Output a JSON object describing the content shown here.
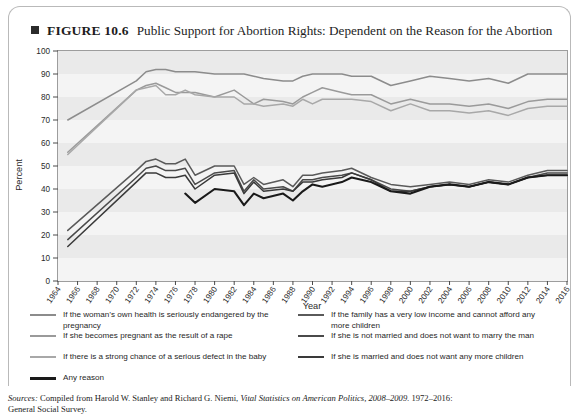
{
  "figure": {
    "marker": "■",
    "number": "FIGURE 10.6",
    "title": "Public Support for Abortion Rights: Dependent on the Reason for the Abortion"
  },
  "source": {
    "prefix": "Sources:",
    "line1_plain_a": " Compiled from Harold W. Stanley and Richard G. Niemi, ",
    "line1_italic": "Vital Statistics on American Politics, 2008–2009.",
    "line1_plain_b": " 1972–2016:",
    "line2": "General Social Survey."
  },
  "legend": {
    "items": [
      {
        "label": "If the woman’s own health is seriously endangered by the pregnancy",
        "color": "#8c8c8c",
        "name": "legend-item-health"
      },
      {
        "label": "If she becomes pregnant as the result of a rape",
        "color": "#9a9a9a",
        "name": "legend-item-rape"
      },
      {
        "label": "If there is a strong chance of a serious defect in the baby",
        "color": "#a8a8a8",
        "name": "legend-item-defect"
      },
      {
        "label": "Any reason",
        "color": "#1a1a1a",
        "name": "legend-item-any-reason"
      },
      {
        "label": "If the family has a very low income and cannot afford any more children",
        "color": "#5a5a5a",
        "name": "legend-item-low-income"
      },
      {
        "label": "If she is not married and does not want to marry the man",
        "color": "#4a4a4a",
        "name": "legend-item-not-married"
      },
      {
        "label": "If she is married and does not want any more children",
        "color": "#3a3a3a",
        "name": "legend-item-married-no-more"
      }
    ]
  },
  "chart_data": {
    "type": "line",
    "title": "Public Support for Abortion Rights: Dependent on the Reason for the Abortion",
    "xlabel": "Year",
    "ylabel": "Percent",
    "ylim": [
      0,
      100
    ],
    "ytick_step": 10,
    "yticks": [
      0,
      10,
      20,
      30,
      40,
      50,
      60,
      70,
      80,
      90,
      100
    ],
    "xlim": [
      1964,
      2016
    ],
    "xticks": [
      1964,
      1966,
      1968,
      1970,
      1972,
      1974,
      1976,
      1978,
      1980,
      1982,
      1984,
      1986,
      1988,
      1990,
      1992,
      1994,
      1996,
      1998,
      2000,
      2002,
      2004,
      2006,
      2008,
      2010,
      2012,
      2014,
      2016
    ],
    "grid": "horizontal-bands",
    "legend_position": "below",
    "series": [
      {
        "name": "If the woman’s own health is seriously endangered by the pregnancy",
        "color": "#8c8c8c",
        "x": [
          1965,
          1972,
          1973,
          1974,
          1975,
          1976,
          1977,
          1978,
          1980,
          1982,
          1983,
          1984,
          1985,
          1987,
          1988,
          1989,
          1990,
          1991,
          1993,
          1994,
          1996,
          1998,
          2000,
          2002,
          2004,
          2006,
          2008,
          2010,
          2012,
          2014,
          2016
        ],
        "values": [
          70,
          87,
          91,
          92,
          92,
          91,
          91,
          91,
          90,
          90,
          90,
          89,
          88,
          87,
          87,
          89,
          90,
          90,
          90,
          89,
          89,
          85,
          87,
          89,
          88,
          87,
          88,
          86,
          90,
          90,
          90
        ]
      },
      {
        "name": "If she becomes pregnant as the result of a rape",
        "color": "#9a9a9a",
        "x": [
          1965,
          1972,
          1973,
          1974,
          1975,
          1976,
          1977,
          1978,
          1980,
          1982,
          1983,
          1984,
          1985,
          1987,
          1988,
          1989,
          1990,
          1991,
          1993,
          1994,
          1996,
          1998,
          2000,
          2002,
          2004,
          2006,
          2008,
          2010,
          2012,
          2014,
          2016
        ],
        "values": [
          56,
          83,
          85,
          86,
          84,
          82,
          82,
          82,
          80,
          83,
          80,
          77,
          79,
          78,
          77,
          80,
          82,
          84,
          82,
          81,
          81,
          77,
          79,
          77,
          77,
          76,
          77,
          75,
          78,
          79,
          79
        ]
      },
      {
        "name": "If there is a strong chance of a serious defect in the baby",
        "color": "#a8a8a8",
        "x": [
          1965,
          1972,
          1973,
          1974,
          1975,
          1976,
          1977,
          1978,
          1980,
          1982,
          1983,
          1984,
          1985,
          1987,
          1988,
          1989,
          1990,
          1991,
          1993,
          1994,
          1996,
          1998,
          2000,
          2002,
          2004,
          2006,
          2008,
          2010,
          2012,
          2014,
          2016
        ],
        "values": [
          55,
          83,
          84,
          85,
          81,
          81,
          83,
          81,
          80,
          80,
          77,
          77,
          76,
          77,
          76,
          79,
          77,
          79,
          79,
          79,
          78,
          74,
          77,
          74,
          74,
          73,
          74,
          72,
          75,
          76,
          76
        ]
      },
      {
        "name": "If the family has a very low income and cannot afford any more children",
        "color": "#5a5a5a",
        "x": [
          1965,
          1972,
          1973,
          1974,
          1975,
          1976,
          1977,
          1978,
          1980,
          1982,
          1983,
          1984,
          1985,
          1987,
          1988,
          1989,
          1990,
          1991,
          1993,
          1994,
          1996,
          1998,
          2000,
          2002,
          2004,
          2006,
          2008,
          2010,
          2012,
          2014,
          2016
        ],
        "values": [
          22,
          48,
          52,
          53,
          51,
          51,
          53,
          46,
          50,
          50,
          42,
          45,
          42,
          44,
          41,
          46,
          46,
          47,
          48,
          49,
          45,
          42,
          41,
          42,
          43,
          42,
          44,
          43,
          46,
          48,
          48
        ]
      },
      {
        "name": "If she is not married and does not want to marry the man",
        "color": "#4a4a4a",
        "x": [
          1965,
          1972,
          1973,
          1974,
          1975,
          1976,
          1977,
          1978,
          1980,
          1982,
          1983,
          1984,
          1985,
          1987,
          1988,
          1989,
          1990,
          1991,
          1993,
          1994,
          1996,
          1998,
          2000,
          2002,
          2004,
          2006,
          2008,
          2010,
          2012,
          2014,
          2016
        ],
        "values": [
          18,
          45,
          49,
          50,
          48,
          48,
          49,
          42,
          47,
          48,
          39,
          44,
          40,
          41,
          39,
          44,
          44,
          45,
          46,
          47,
          44,
          40,
          39,
          41,
          42,
          41,
          43,
          42,
          45,
          47,
          47
        ]
      },
      {
        "name": "If she is married and does not want any more children",
        "color": "#3a3a3a",
        "x": [
          1965,
          1972,
          1973,
          1974,
          1975,
          1976,
          1977,
          1978,
          1980,
          1982,
          1983,
          1984,
          1985,
          1987,
          1988,
          1989,
          1990,
          1991,
          1993,
          1994,
          1996,
          1998,
          2000,
          2002,
          2004,
          2006,
          2008,
          2010,
          2012,
          2014,
          2016
        ],
        "values": [
          15,
          43,
          47,
          47,
          45,
          45,
          46,
          40,
          46,
          47,
          38,
          43,
          39,
          40,
          39,
          43,
          43,
          44,
          45,
          47,
          44,
          39,
          39,
          41,
          42,
          41,
          43,
          42,
          45,
          46,
          46
        ]
      },
      {
        "name": "Any reason",
        "color": "#1a1a1a",
        "x": [
          1977,
          1978,
          1980,
          1982,
          1983,
          1984,
          1985,
          1987,
          1988,
          1989,
          1990,
          1991,
          1993,
          1994,
          1996,
          1998,
          2000,
          2002,
          2004,
          2006,
          2008,
          2010,
          2012,
          2014,
          2016
        ],
        "values": [
          38,
          34,
          40,
          39,
          33,
          38,
          36,
          38,
          35,
          39,
          42,
          41,
          43,
          45,
          43,
          39,
          38,
          41,
          42,
          41,
          43,
          42,
          45,
          46,
          46
        ]
      }
    ]
  }
}
